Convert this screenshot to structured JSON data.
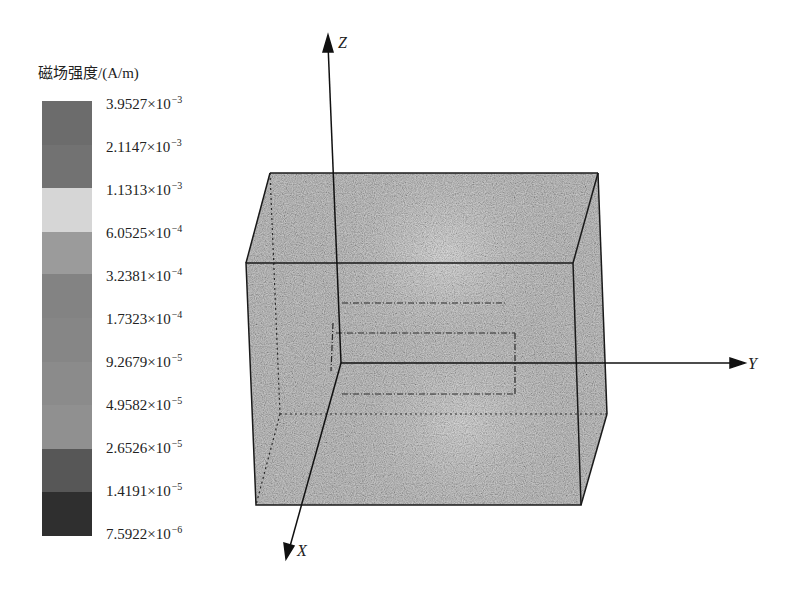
{
  "legend": {
    "title": "磁场强度/(A/m)",
    "ticks": [
      {
        "mantissa": "3.9527",
        "times": "×10",
        "exp": "−3"
      },
      {
        "mantissa": "2.1147",
        "times": "×10",
        "exp": "−3"
      },
      {
        "mantissa": "1.1313",
        "times": "×10",
        "exp": "−3"
      },
      {
        "mantissa": "6.0525",
        "times": "×10",
        "exp": "−4"
      },
      {
        "mantissa": "3.2381",
        "times": "×10",
        "exp": "−4"
      },
      {
        "mantissa": "1.7323",
        "times": "×10",
        "exp": "−4"
      },
      {
        "mantissa": "9.2679",
        "times": "×10",
        "exp": "−5"
      },
      {
        "mantissa": "4.9582",
        "times": "×10",
        "exp": "−5"
      },
      {
        "mantissa": "2.6526",
        "times": "×10",
        "exp": "−5"
      },
      {
        "mantissa": "1.4191",
        "times": "×10",
        "exp": "−5"
      },
      {
        "mantissa": "7.5922",
        "times": "×10",
        "exp": "−6"
      }
    ],
    "bands": [
      {
        "color": "#6d6d6d"
      },
      {
        "color": "#707070"
      },
      {
        "color": "#d9d9d9"
      },
      {
        "color": "#9a9a9a"
      },
      {
        "color": "#828282"
      },
      {
        "color": "#858585"
      },
      {
        "color": "#8a8a8a"
      },
      {
        "color": "#8f8f8f"
      },
      {
        "color": "#565656"
      },
      {
        "color": "#2e2e2e"
      }
    ]
  },
  "axes": {
    "x_label": "X",
    "y_label": "Y",
    "z_label": "Z"
  },
  "colors": {
    "box_fill": "#9c9c9c",
    "edge": "#1a1a1a"
  }
}
